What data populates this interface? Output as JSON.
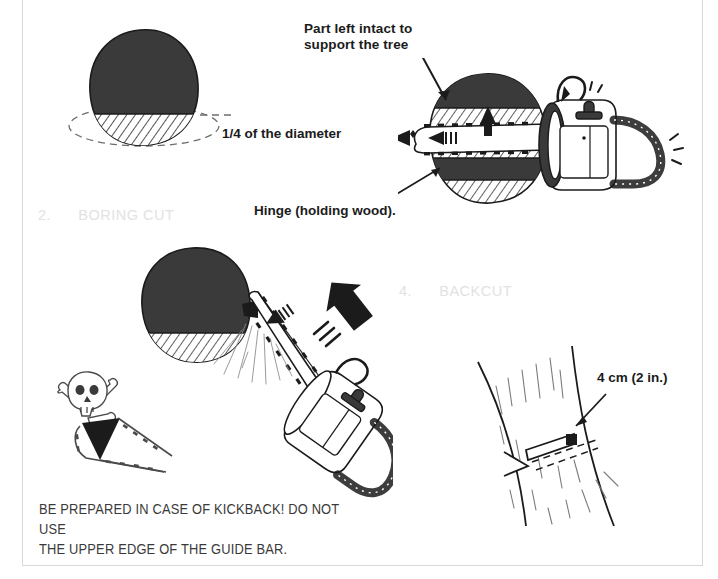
{
  "page": {
    "background_color": "#ffffff",
    "frame_color": "#d8d8d8",
    "ink_color": "#1b1b1b",
    "faded_text_color": "#e2e2e2"
  },
  "labels": {
    "part_intact": "Part left intact to\nsupport the tree",
    "quarter_diameter": "1/4 of the diameter",
    "hinge": "Hinge (holding wood).",
    "measure_4cm": "4 cm (2 in.)"
  },
  "steps": [
    {
      "number": "2.",
      "name": "BORING CUT",
      "faded": true
    },
    {
      "number": "4.",
      "name": "BACKCUT",
      "faded": true
    }
  ],
  "step_text": {
    "boring": "2.      BORING CUT",
    "backcut": "4.      BACKCUT"
  },
  "warning": {
    "text": "BE PREPARED IN CASE OF KICKBACK! DO NOT USE\nTHE UPPER EDGE OF THE GUIDE BAR."
  },
  "figures": [
    {
      "id": "trunk-cross-section",
      "caption": "Tree trunk cross-section with hatched lower quarter and dashed outline"
    },
    {
      "id": "chainsaw-boring-trunk",
      "caption": "Chainsaw boring through trunk showing hinge and intact support wood"
    },
    {
      "id": "chainsaw-boring-cut",
      "caption": "Chainsaw performing boring cut with sawdust and kickback arrow"
    },
    {
      "id": "kickback-skull-warning",
      "caption": "Skull and crossbones over guide bar kickback zone"
    },
    {
      "id": "trunk-backcut",
      "caption": "Standing trunk with notch and backcut offset 4 cm"
    }
  ]
}
